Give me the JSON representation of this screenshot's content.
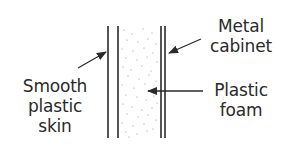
{
  "diagram": {
    "type": "cross-section",
    "colors": {
      "ink": "#2a2a2a",
      "stipple": "#8a8a8a",
      "background": "#ffffff"
    },
    "layers": [
      {
        "name": "Smooth plastic skin",
        "position": "left"
      },
      {
        "name": "Plastic foam",
        "position": "middle"
      },
      {
        "name": "Metal cabinet",
        "position": "right"
      }
    ],
    "labels": {
      "metal_cabinet": {
        "line1": "Metal",
        "line2": "cabinet"
      },
      "smooth_plastic_skin": {
        "line1": "Smooth",
        "line2": "plastic",
        "line3": "skin"
      },
      "plastic_foam": {
        "line1": "Plastic",
        "line2": "foam"
      }
    }
  }
}
